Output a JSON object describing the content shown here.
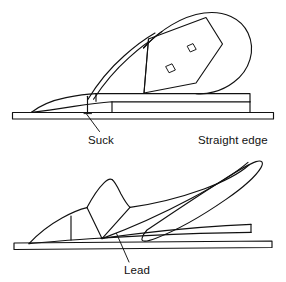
{
  "figure": {
    "background_color": "#ffffff",
    "line_color": "#111111",
    "width": 286,
    "height": 282
  },
  "labels": {
    "suck": "Suck",
    "straight_edge": "Straight edge",
    "lead": "Lead"
  },
  "panels": [
    {
      "id": "top",
      "name": "suck-panel",
      "defect": "Suck",
      "description": "Plane sole hollow in the middle; gap visible between sole and straight edge behind the mouth",
      "annotations": [
        "Suck",
        "Straight edge"
      ]
    },
    {
      "id": "bottom",
      "name": "lead-panel",
      "defect": "Lead",
      "description": "Plane sole convex so the body rides up and leads away from the straight edge toward the heel",
      "annotations": [
        "Lead"
      ]
    }
  ],
  "parts": {
    "tote": "tote-handle",
    "knob": "front-knob",
    "lever_cap": "lever-cap",
    "lever_cap_slots": 2,
    "body": "plane-body",
    "sole": "plane-sole",
    "straight_edge_bar": "straight-edge-bar"
  }
}
